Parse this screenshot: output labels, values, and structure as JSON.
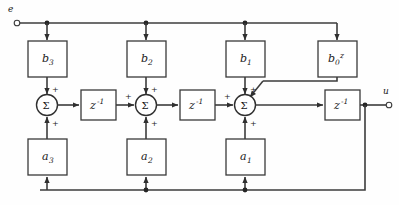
{
  "diagram": {
    "input_port": {
      "label": "e",
      "name": "input-terminal"
    },
    "output_port": {
      "label": "u",
      "name": "output-terminal"
    },
    "gain_blocks_feedforward": [
      {
        "id": "b3",
        "base": "b",
        "sub": "3",
        "sup": ""
      },
      {
        "id": "b2",
        "base": "b",
        "sub": "2",
        "sup": ""
      },
      {
        "id": "b1",
        "base": "b",
        "sub": "1",
        "sup": ""
      },
      {
        "id": "b0z",
        "base": "b",
        "sub": "0",
        "sup": "z"
      }
    ],
    "gain_blocks_feedback": [
      {
        "id": "a3",
        "base": "a",
        "sub": "3",
        "sup": ""
      },
      {
        "id": "a2",
        "base": "a",
        "sub": "2",
        "sup": ""
      },
      {
        "id": "a1",
        "base": "a",
        "sub": "1",
        "sup": ""
      }
    ],
    "delay_blocks": [
      {
        "id": "z1",
        "base": "z",
        "sup": "-1"
      },
      {
        "id": "z2",
        "base": "z",
        "sup": "-1"
      },
      {
        "id": "z3",
        "base": "z",
        "sup": "-1"
      }
    ],
    "summers": [
      {
        "id": "sum1",
        "glyph": "Σ",
        "signs": [
          "+",
          "+"
        ]
      },
      {
        "id": "sum2",
        "glyph": "Σ",
        "signs": [
          "+",
          "+",
          "+"
        ]
      },
      {
        "id": "sum3",
        "glyph": "Σ",
        "signs": [
          "+",
          "+",
          "+"
        ]
      }
    ],
    "colors": {
      "wire": "#3c3c3c",
      "box_stroke": "#3a3a3a",
      "box_fill": "#ffffff",
      "text": "#1a1a1a",
      "background": "#fefefe"
    }
  }
}
